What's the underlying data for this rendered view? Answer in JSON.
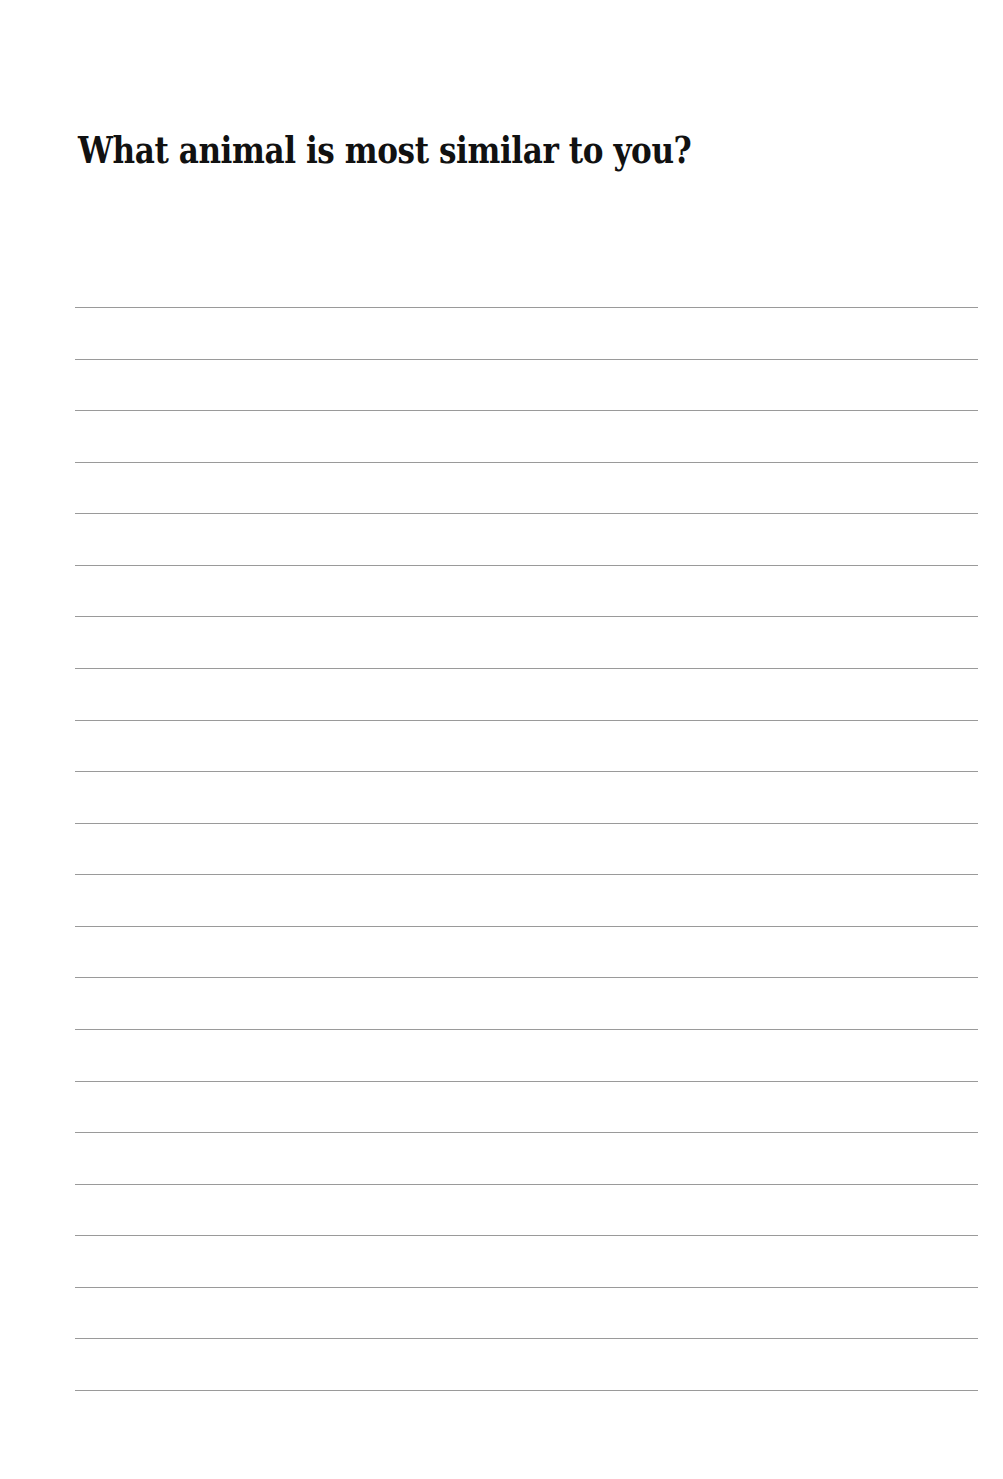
{
  "page": {
    "title": "What animal is most similar to you?",
    "writing_lines": {
      "count": 22,
      "first_y": 307,
      "spacing": 51.57,
      "color": "#9a9a9a"
    }
  }
}
